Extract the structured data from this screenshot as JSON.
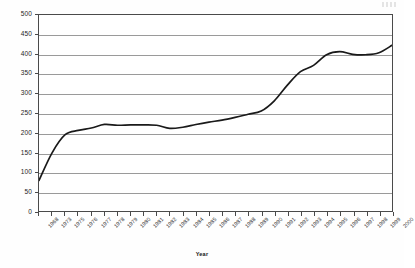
{
  "chart_data": {
    "type": "line",
    "title": "",
    "xlabel": "Year",
    "ylabel": "Billions of dollars",
    "ylim": [
      0,
      500
    ],
    "ytick_step": 50,
    "yticks": [
      "0",
      "50",
      "100",
      "150",
      "200",
      "250",
      "300",
      "350",
      "400",
      "450",
      "500"
    ],
    "grid": true,
    "legend": "none",
    "categories": [
      "1968",
      "1973",
      "1975",
      "1976",
      "1977",
      "1978",
      "1979",
      "1980",
      "1981",
      "1982",
      "1983",
      "1984",
      "1985",
      "1986",
      "1987",
      "1988",
      "1989",
      "1990",
      "1991",
      "1992",
      "1993",
      "1994",
      "1995",
      "1996",
      "1997",
      "1998",
      "1999",
      "2000"
    ],
    "series": [
      {
        "name": "Billions of dollars",
        "color": "#1a1a1a",
        "values": [
          80,
          150,
          196,
          207,
          213,
          222,
          220,
          221,
          221,
          220,
          212,
          215,
          222,
          228,
          233,
          240,
          248,
          256,
          282,
          322,
          356,
          372,
          399,
          407,
          400,
          399,
          404,
          423
        ]
      }
    ]
  },
  "axes": {
    "y_title": "Billions of dollars",
    "x_title": "Year"
  }
}
